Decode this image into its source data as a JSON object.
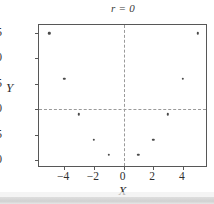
{
  "chart_data": {
    "type": "scatter",
    "title": "r = 0",
    "xlabel": "X",
    "ylabel": "Y",
    "xlim": [
      -5.7,
      5.7
    ],
    "ylim": [
      -1.6,
      26.6
    ],
    "xticks": [
      -4,
      -2,
      0,
      2,
      4
    ],
    "xticklabels": [
      "−4",
      "−2",
      "0",
      "2",
      "4"
    ],
    "yticks": [
      0,
      5,
      10,
      15,
      20,
      25
    ],
    "yticklabels": [
      "0",
      "5",
      "10",
      "15",
      "20",
      "25"
    ],
    "grid": true,
    "gridlines": {
      "vertical": [
        0
      ],
      "horizontal": [
        10
      ]
    },
    "legend": null,
    "relationship": "y = x^2",
    "correlation": 0,
    "points": [
      {
        "x": -5,
        "y": 25
      },
      {
        "x": -4,
        "y": 16
      },
      {
        "x": -3,
        "y": 9
      },
      {
        "x": -2,
        "y": 4
      },
      {
        "x": -1,
        "y": 1
      },
      {
        "x": 1,
        "y": 1
      },
      {
        "x": 2,
        "y": 4
      },
      {
        "x": 3,
        "y": 9
      },
      {
        "x": 4,
        "y": 16
      },
      {
        "x": 5,
        "y": 25
      }
    ],
    "marker": {
      "shape": "dot",
      "color": "#4a4a4a",
      "size": 2.4
    },
    "colors": {
      "frame": "#575757",
      "grid": "#9a9a9a",
      "text": "#2f2f2f",
      "background": "#ffffff"
    }
  }
}
